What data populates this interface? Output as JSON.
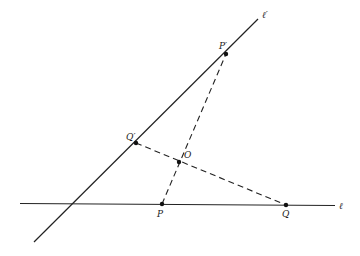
{
  "diagram": {
    "lines": {
      "l": {
        "label": "ℓ",
        "x1": 20,
        "y1": 203.5,
        "x2": 335,
        "y2": 205.5
      },
      "l_prime": {
        "label": "ℓ′",
        "x1": 34,
        "y1": 242,
        "x2": 258,
        "y2": 19
      }
    },
    "segments": [
      {
        "from": "P",
        "to": "P'",
        "style": "dashed"
      },
      {
        "from": "Q'",
        "to": "Q",
        "style": "dashed"
      }
    ],
    "points": {
      "P_prime": {
        "label": "P′",
        "x": 226,
        "y": 54
      },
      "Q_prime": {
        "label": "Q′",
        "x": 136,
        "y": 143
      },
      "O": {
        "label": "O",
        "x": 179,
        "y": 162
      },
      "P": {
        "label": "P",
        "x": 162,
        "y": 204
      },
      "Q": {
        "label": "Q",
        "x": 286,
        "y": 205
      }
    }
  }
}
